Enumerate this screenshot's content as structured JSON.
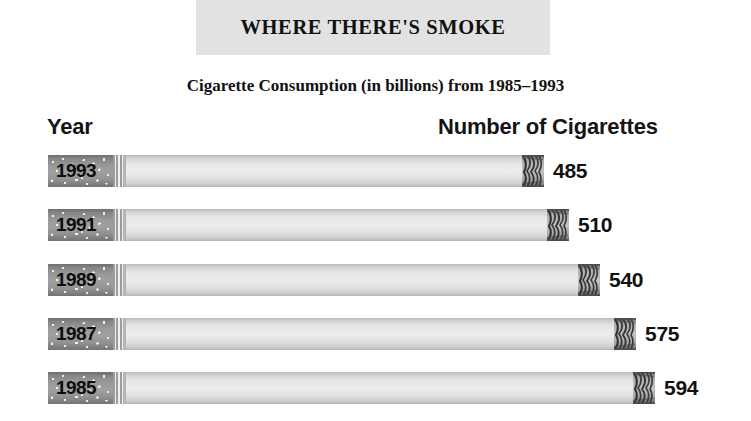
{
  "header": {
    "title": "WHERE THERE'S SMOKE",
    "subtitle": "Cigarette Consumption (in billions) from 1985–1993",
    "band_color": "#e2e2e2"
  },
  "axes": {
    "left_label": "Year",
    "right_label": "Number of Cigarettes"
  },
  "chart_data": {
    "type": "bar",
    "orientation": "horizontal",
    "title": "WHERE THERE'S SMOKE",
    "subtitle": "Cigarette Consumption (in billions) from 1985–1993",
    "xlabel": "Number of Cigarettes",
    "ylabel": "Year",
    "units": "billions",
    "grid": false,
    "legend": false,
    "xlim": [
      0,
      594
    ],
    "categories": [
      "1993",
      "1991",
      "1989",
      "1987",
      "1985"
    ],
    "values": [
      485,
      510,
      540,
      575,
      594
    ],
    "value_labels": [
      "485",
      "510",
      "540",
      "575",
      "594"
    ],
    "bars": [
      {
        "year": "1993",
        "value": 485,
        "label": "485"
      },
      {
        "year": "1991",
        "value": 510,
        "label": "510"
      },
      {
        "year": "1989",
        "value": 540,
        "label": "540"
      },
      {
        "year": "1987",
        "value": 575,
        "label": "575"
      },
      {
        "year": "1985",
        "value": 594,
        "label": "594"
      }
    ],
    "style": {
      "bar_glyph": "cigarette",
      "filter_color": "#919191",
      "paper_color": "#e8e8e8",
      "tip_color": "#5a5a5a",
      "text_color": "#111111",
      "background": "#ffffff"
    }
  }
}
